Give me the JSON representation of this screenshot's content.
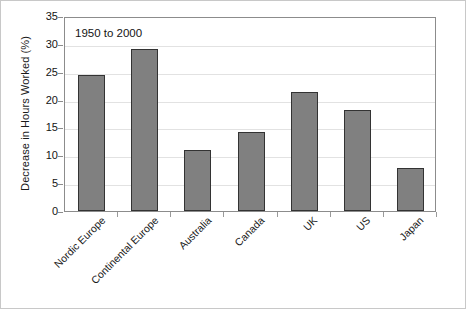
{
  "chart_data": {
    "type": "bar",
    "title": "",
    "annotation": "1950 to 2000",
    "xlabel": "",
    "ylabel": "Decrease in Hours Worked (%)",
    "ylim": [
      0,
      35
    ],
    "yticks": [
      0,
      5,
      10,
      15,
      20,
      25,
      30,
      35
    ],
    "ytick_labels": [
      "0",
      "5",
      "10",
      "15",
      "20",
      "25",
      "30",
      "35"
    ],
    "grid": true,
    "legend": "none",
    "categories": [
      "Nordic Europe",
      "Continental Europe",
      "Australia",
      "Canada",
      "UK",
      "US",
      "Japan"
    ],
    "values": [
      24.5,
      29.0,
      11.0,
      14.1,
      21.3,
      18.2,
      7.7
    ],
    "colors": {
      "bar_fill": "#808080",
      "bar_border": "#333333",
      "gridline": "#e2e2e2",
      "axis": "#8c8c8c",
      "text": "#141414",
      "background": "#ffffff",
      "outer_border": "#c8c8c8"
    }
  }
}
